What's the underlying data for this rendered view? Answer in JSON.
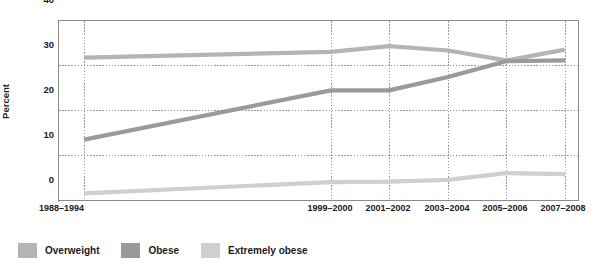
{
  "chart_data": {
    "type": "line",
    "title": "",
    "xlabel": "",
    "ylabel": "Percent",
    "ylim": [
      0,
      40
    ],
    "yticks": [
      0,
      10,
      20,
      30,
      40
    ],
    "grid": "dotted horizontal gridlines at 10, 20, 30 and dotted vertical gridlines at each period",
    "legend_position": "below-left",
    "categories": [
      "1988–1994",
      "1999–2000",
      "2001–2002",
      "2003–2004",
      "2005–2006",
      "2007–2008"
    ],
    "series": [
      {
        "name": "Overweight",
        "color": "#b4b4b4",
        "values": [
          31.8,
          33.1,
          34.4,
          33.4,
          31.2,
          33.6
        ]
      },
      {
        "name": "Obese",
        "color": "#9a9a9a",
        "values": [
          13.5,
          24.5,
          24.5,
          27.5,
          31.0,
          31.2
        ]
      },
      {
        "name": "Extremely obese",
        "color": "#cfcfcf",
        "values": [
          1.5,
          4.0,
          4.1,
          4.5,
          6.0,
          5.8
        ]
      }
    ]
  },
  "axis": {
    "y_title": "Percent",
    "y_tick_labels": [
      "40",
      "30",
      "20",
      "10",
      "0"
    ],
    "x_tick_labels": [
      "1988–1994",
      "1999–2000",
      "2001–2002",
      "2003–2004",
      "2005–2006",
      "2007–2008"
    ]
  },
  "legend": {
    "items": [
      {
        "label": "Overweight",
        "color": "#b4b4b4"
      },
      {
        "label": "Obese",
        "color": "#9a9a9a"
      },
      {
        "label": "Extremely obese",
        "color": "#cfcfcf"
      }
    ]
  },
  "colors": {
    "overweight": "#b4b4b4",
    "obese": "#9a9a9a",
    "extremely_obese": "#cfcfcf",
    "axis": "#8a8a8a",
    "grid": "#9a9a9a",
    "text": "#1b1b1b",
    "background": "#ffffff"
  }
}
